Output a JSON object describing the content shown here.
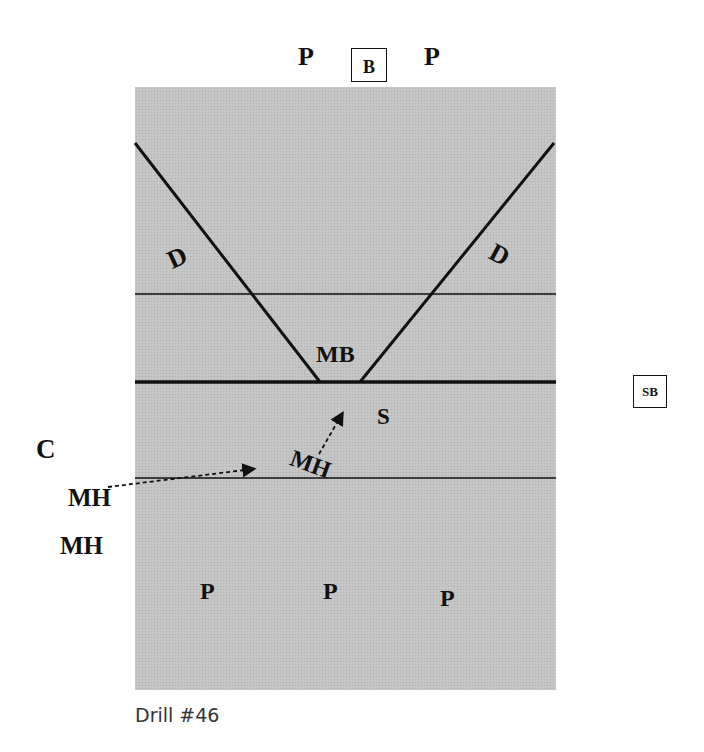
{
  "diagram": {
    "caption": "Drill #46",
    "top_players": {
      "left": "P",
      "box": "B",
      "right": "P"
    },
    "diggers": {
      "left": "D",
      "right": "D"
    },
    "middle_blocker": "MB",
    "setter": "S",
    "side_box": "SB",
    "coach": "C",
    "hitters": {
      "court": "MH",
      "waiting_1": "MH",
      "waiting_2": "MH"
    },
    "bottom_players": [
      "P",
      "P",
      "P"
    ],
    "colors": {
      "court": "#c4c4c4",
      "lines": "#111111",
      "text": "#111111"
    }
  }
}
